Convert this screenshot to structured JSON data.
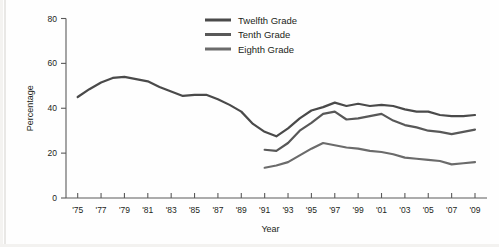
{
  "chart_data": {
    "type": "line",
    "title": "",
    "xlabel": "Year",
    "ylabel": "Percentage",
    "xlim": [
      1974,
      2009
    ],
    "ylim": [
      0,
      80
    ],
    "yticks": [
      0,
      20,
      40,
      60,
      80
    ],
    "ytick_labels": [
      "0",
      "20",
      "40",
      "60",
      "80"
    ],
    "xticks": [
      1975,
      1977,
      1979,
      1981,
      1983,
      1985,
      1987,
      1989,
      1991,
      1993,
      1995,
      1997,
      1999,
      2001,
      2003,
      2005,
      2007,
      2009
    ],
    "xtick_labels": [
      "'75",
      "'77",
      "'79",
      "'81",
      "'83",
      "'85",
      "'87",
      "'89",
      "'91",
      "'93",
      "'95",
      "'97",
      "'99",
      "'01",
      "'03",
      "'05",
      "'07",
      "'09"
    ],
    "grid": false,
    "legend_position": "top-center",
    "series": [
      {
        "name": "Twelfth Grade",
        "color": "#4a4a4a",
        "x": [
          1975,
          1976,
          1977,
          1978,
          1979,
          1980,
          1981,
          1982,
          1983,
          1984,
          1985,
          1986,
          1987,
          1988,
          1989,
          1990,
          1991,
          1992,
          1993,
          1994,
          1995,
          1996,
          1997,
          1998,
          1999,
          2000,
          2001,
          2002,
          2003,
          2004,
          2005,
          2006,
          2007,
          2008,
          2009
        ],
        "values": [
          45.0,
          48.5,
          51.5,
          53.5,
          54.0,
          53.0,
          52.0,
          49.5,
          47.5,
          45.5,
          46.0,
          46.0,
          44.0,
          41.5,
          38.5,
          33.0,
          29.5,
          27.5,
          31.0,
          35.5,
          39.0,
          40.5,
          42.5,
          41.0,
          42.0,
          41.0,
          41.5,
          41.0,
          39.5,
          38.5,
          38.5,
          37.0,
          36.5,
          36.5,
          37.0
        ],
        "legend_order": 1
      },
      {
        "name": "Tenth Grade",
        "color": "#585858",
        "x": [
          1991,
          1992,
          1993,
          1994,
          1995,
          1996,
          1997,
          1998,
          1999,
          2000,
          2001,
          2002,
          2003,
          2004,
          2005,
          2006,
          2007,
          2008,
          2009
        ],
        "values": [
          21.5,
          21.0,
          24.5,
          30.0,
          33.5,
          37.5,
          38.5,
          35.0,
          35.5,
          36.5,
          37.5,
          34.5,
          32.5,
          31.5,
          30.0,
          29.5,
          28.5,
          29.5,
          30.5
        ],
        "legend_order": 2
      },
      {
        "name": "Eighth Grade",
        "color": "#6b6b6b",
        "x": [
          1991,
          1992,
          1993,
          1994,
          1995,
          1996,
          1997,
          1998,
          1999,
          2000,
          2001,
          2002,
          2003,
          2004,
          2005,
          2006,
          2007,
          2008,
          2009
        ],
        "values": [
          13.5,
          14.5,
          16.0,
          19.0,
          22.0,
          24.5,
          23.5,
          22.5,
          22.0,
          21.0,
          20.5,
          19.5,
          18.0,
          17.5,
          17.0,
          16.5,
          15.0,
          15.5,
          16.0
        ],
        "legend_order": 3
      }
    ]
  },
  "legend": {
    "items": [
      {
        "label": "Twelfth Grade"
      },
      {
        "label": "Tenth Grade"
      },
      {
        "label": "Eighth Grade"
      }
    ]
  },
  "axes": {
    "y_title": "Percentage",
    "x_title": "Year"
  }
}
